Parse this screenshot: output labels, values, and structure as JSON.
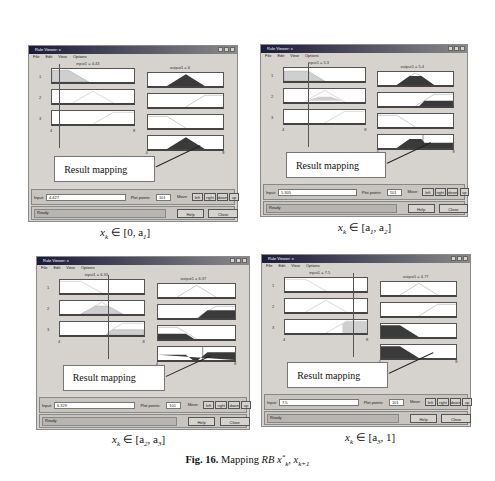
{
  "figure": {
    "caption_label": "Fig. 16.",
    "caption_text": "Mapping ",
    "caption_math": "RB x*k, xk+1"
  },
  "windows": [
    {
      "title": "Rule Viewer: x",
      "menu": [
        "File",
        "Edit",
        "View",
        "Options"
      ],
      "input_header": "input1 = 4.43",
      "output_header": "output1 = 6",
      "row_labels": [
        "1",
        "2",
        "3"
      ],
      "input_axis": [
        "4",
        "8"
      ],
      "output_axis": [
        "4",
        "8"
      ],
      "callout": "Result mapping",
      "input_label": "Input:",
      "input_value": "4.427",
      "plot_points_label": "Plot points:",
      "plot_points_value": "101",
      "move_label": "Move:",
      "move_buttons": [
        "left",
        "right",
        "down",
        "up"
      ],
      "status": "Ready",
      "help_label": "Help",
      "close_label": "Close",
      "subcaption": "x_k ∈ [0, a_1]"
    },
    {
      "title": "Rule Viewer: x",
      "menu": [
        "File",
        "Edit",
        "View",
        "Options"
      ],
      "input_header": "input1 = 5.3",
      "output_header": "output1 = 5.4",
      "row_labels": [
        "1",
        "2",
        "3"
      ],
      "input_axis": [
        "4",
        "8"
      ],
      "output_axis": [
        "4",
        "8"
      ],
      "callout": "Result mapping",
      "input_label": "Input:",
      "input_value": "5.305",
      "plot_points_label": "Plot points:",
      "plot_points_value": "101",
      "move_label": "Move:",
      "move_buttons": [
        "left",
        "right",
        "down",
        "up"
      ],
      "status": "Ready",
      "help_label": "Help",
      "close_label": "Close",
      "subcaption": "x_k ∈ [a_1, a_2]"
    },
    {
      "title": "Rule Viewer: x",
      "menu": [
        "File",
        "Edit",
        "View",
        "Options"
      ],
      "input_header": "input1 = 6.33",
      "output_header": "output1 = 6.37",
      "row_labels": [
        "1",
        "2",
        "3"
      ],
      "input_axis": [
        "4",
        "8"
      ],
      "output_axis": [
        "4",
        "8"
      ],
      "callout": "Result mapping",
      "input_label": "Input:",
      "input_value": "6.329",
      "plot_points_label": "Plot points:",
      "plot_points_value": "101",
      "move_label": "Move:",
      "move_buttons": [
        "left",
        "right",
        "down",
        "up"
      ],
      "status": "Ready",
      "help_label": "Help",
      "close_label": "Close",
      "subcaption": "x_k ∈ [a_2, a_3]"
    },
    {
      "title": "Rule Viewer: x",
      "menu": [
        "File",
        "Edit",
        "View",
        "Options"
      ],
      "input_header": "input1 = 7.5",
      "output_header": "output1 = 4.77",
      "row_labels": [
        "1",
        "2",
        "3"
      ],
      "input_axis": [
        "4",
        "8"
      ],
      "output_axis": [
        "4",
        "8"
      ],
      "callout": "Result mapping",
      "input_label": "Input:",
      "input_value": "7.5",
      "plot_points_label": "Plot points:",
      "plot_points_value": "101",
      "move_label": "Move:",
      "move_buttons": [
        "left",
        "right",
        "down",
        "up"
      ],
      "status": "Ready",
      "help_label": "Help",
      "close_label": "Close",
      "subcaption": "x_k ∈ [a_3, 1]"
    }
  ],
  "subcaptions_rendered": [
    {
      "x": "x",
      "sub": "k",
      "rest": " ∈ [0, a",
      "s1": "1",
      "end": "]"
    },
    {
      "x": "x",
      "sub": "k",
      "rest": " ∈ [a",
      "s1": "1",
      "mid": ", a",
      "s2": "2",
      "end": "]"
    },
    {
      "x": "x",
      "sub": "k",
      "rest": " ∈ [a",
      "s1": "2",
      "mid": ", a",
      "s2": "3",
      "end": "]"
    },
    {
      "x": "x",
      "sub": "k",
      "rest": " ∈ [a",
      "s1": "3",
      "mid": ", 1",
      "end": "]"
    }
  ],
  "colors": {
    "window_bg": "#d6d3ce",
    "title_dark": "#1a1a3a",
    "fill_dark": "#3a3a3a",
    "fill_light": "#cfcfcf",
    "mf_line": "#999999"
  }
}
